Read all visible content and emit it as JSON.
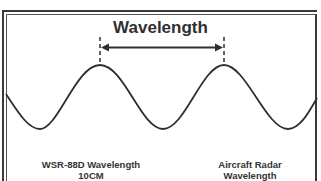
{
  "diagram": {
    "title": "Wavelength",
    "left_label": {
      "line1": "WSR-88D Wavelength",
      "line2": "10CM"
    },
    "right_label": {
      "line1": "Aircraft Radar Wavelength",
      "line2": "3CM"
    },
    "colors": {
      "line": "#2f2f2f",
      "background": "#ffffff",
      "frame": "#3a3a3a"
    }
  }
}
